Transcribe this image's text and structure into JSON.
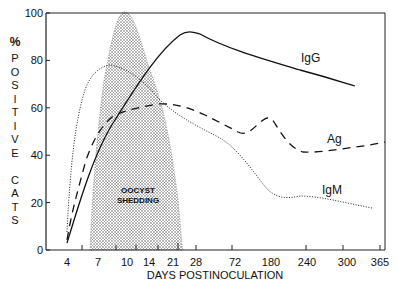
{
  "chart_data": {
    "type": "line",
    "title": "",
    "xlabel": "DAYS POSTINOCULATION",
    "ylabel": "% POSITIVE CATS",
    "ylim": [
      0,
      100
    ],
    "yticks": [
      0,
      20,
      40,
      60,
      80,
      100
    ],
    "xticks": [
      "4",
      "7",
      "10",
      "14",
      "21",
      "28",
      "72",
      "180",
      "240",
      "300",
      "365"
    ],
    "grid": false,
    "x_scale": "nonlinear (categorical-like spacing)",
    "series": [
      {
        "name": "IgG",
        "style": "solid",
        "points": [
          [
            4,
            3
          ],
          [
            7,
            28
          ],
          [
            10,
            52
          ],
          [
            14,
            75
          ],
          [
            21,
            89
          ],
          [
            28,
            92
          ],
          [
            72,
            84
          ],
          [
            180,
            77
          ],
          [
            240,
            73
          ],
          [
            300,
            69
          ]
        ]
      },
      {
        "name": "Ag",
        "style": "dashed",
        "points": [
          [
            4,
            5
          ],
          [
            7,
            40
          ],
          [
            10,
            57
          ],
          [
            14,
            61
          ],
          [
            21,
            62
          ],
          [
            28,
            59
          ],
          [
            72,
            48
          ],
          [
            100,
            48
          ],
          [
            180,
            56
          ],
          [
            240,
            41
          ],
          [
            300,
            42
          ],
          [
            365,
            46
          ]
        ]
      },
      {
        "name": "IgM",
        "style": "dotted",
        "points": [
          [
            4,
            8
          ],
          [
            7,
            65
          ],
          [
            10,
            78
          ],
          [
            14,
            75
          ],
          [
            21,
            61
          ],
          [
            28,
            55
          ],
          [
            72,
            35
          ],
          [
            180,
            21
          ],
          [
            240,
            23
          ],
          [
            300,
            20
          ],
          [
            365,
            18
          ]
        ]
      }
    ],
    "annotations": [
      {
        "text": "OOCYST SHEDDING",
        "type": "shaded_region",
        "x_range": [
          6,
          23
        ],
        "peak": 100,
        "peak_x": 11
      }
    ]
  },
  "labels": {
    "ylabel_symbol": "%",
    "ylabel_letters": [
      "P",
      "O",
      "S",
      "I",
      "T",
      "I",
      "V",
      "E",
      "",
      "C",
      "A",
      "T",
      "S"
    ],
    "xlabel": "DAYS POSTINOCULATION",
    "series_igg": "IgG",
    "series_ag": "Ag",
    "series_igm": "IgM",
    "shed1": "OOCYST",
    "shed2": "SHEDDING"
  }
}
